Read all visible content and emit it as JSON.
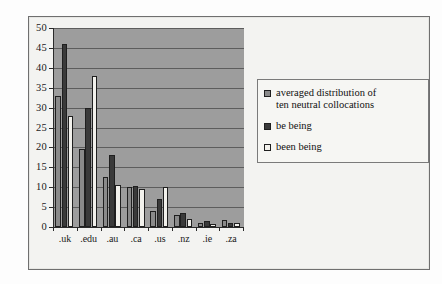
{
  "chart_data": {
    "type": "bar",
    "title": "",
    "subtitle": "",
    "xlabel": "",
    "ylabel": "",
    "categories": [
      ".uk",
      ".edu",
      ".au",
      ".ca",
      ".us",
      ".nz",
      ".ie",
      ".za"
    ],
    "series": [
      {
        "name": "averaged distribution of ten neutral collocations",
        "color": "#8a8a8a",
        "values": [
          33,
          19.5,
          12.5,
          10,
          4,
          3,
          1,
          1.8
        ]
      },
      {
        "name": "be being",
        "color": "#3a3a3a",
        "values": [
          46,
          30,
          18,
          10.3,
          7,
          3.5,
          1.5,
          1
        ]
      },
      {
        "name": "been being",
        "color": "#f2f1ec",
        "values": [
          28,
          38,
          10.5,
          9.5,
          10,
          2,
          0.8,
          1
        ]
      }
    ],
    "ylim": [
      0,
      50
    ],
    "ytick_step": 5,
    "yticks": [
      0,
      5,
      10,
      15,
      20,
      25,
      30,
      35,
      40,
      45,
      50
    ],
    "ytick_labels": [
      "0",
      "5",
      "10",
      "15",
      "20",
      "25",
      "30",
      "35",
      "40",
      "45",
      "50"
    ],
    "grid": true,
    "grid_axis": "y",
    "legend_position": "right",
    "plot_background": "#9d9d9d",
    "page_background": "#f3f3f1",
    "axis_color": "#2a2a2a",
    "gridline_color": "#5d5d5d"
  },
  "legend": {
    "entries": [
      {
        "label_line1": "averaged distribution of",
        "label_line2": "ten neutral collocations"
      },
      {
        "label_line1": "be being",
        "label_line2": ""
      },
      {
        "label_line1": "been being",
        "label_line2": ""
      }
    ]
  }
}
